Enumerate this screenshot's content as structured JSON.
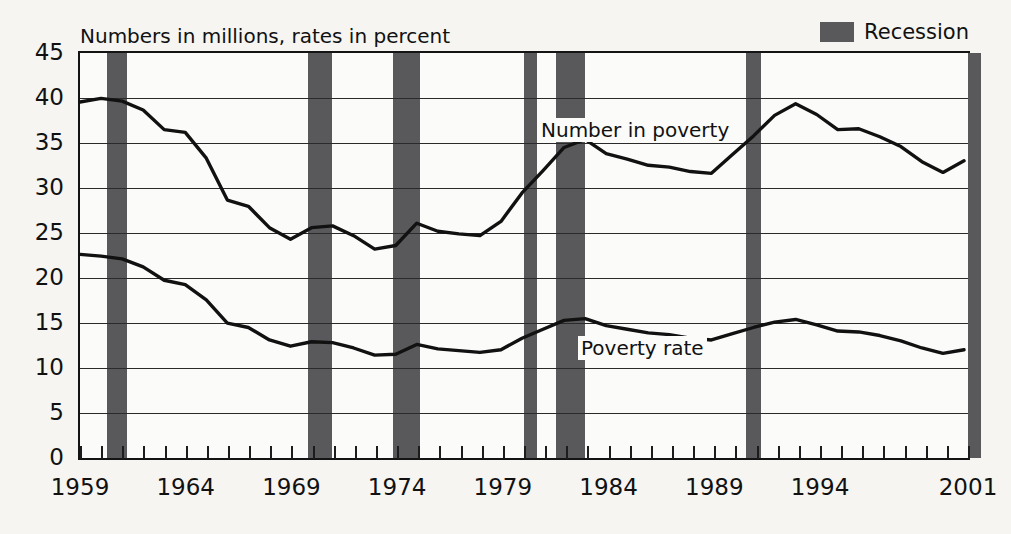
{
  "chart_data": {
    "type": "line",
    "title": "",
    "subtitle": "Numbers in millions, rates in percent",
    "xlabel": "",
    "ylabel": "",
    "ylim": [
      0,
      45
    ],
    "ytick_step": 5,
    "yticks": [
      "45",
      "40",
      "35",
      "30",
      "25",
      "20",
      "15",
      "10",
      "5",
      "0"
    ],
    "xlim": [
      1959,
      2001
    ],
    "xticks": [
      "1959",
      "1964",
      "1969",
      "1974",
      "1979",
      "1984",
      "1989",
      "1994",
      "2001"
    ],
    "xtick_values": [
      1959,
      1964,
      1969,
      1974,
      1979,
      1984,
      1989,
      1994,
      2001
    ],
    "grid": "horizontal",
    "legend_position": "top-right",
    "legend": [
      {
        "label": "Recession",
        "color": "#59595b",
        "kind": "band"
      }
    ],
    "annotations": [
      {
        "label": "Number in poverty",
        "x": 1984,
        "y": 37.5
      },
      {
        "label": "Poverty rate",
        "x": 1986,
        "y": 13.0
      }
    ],
    "x": [
      1959,
      1960,
      1961,
      1962,
      1963,
      1964,
      1965,
      1966,
      1967,
      1968,
      1969,
      1970,
      1971,
      1972,
      1973,
      1974,
      1975,
      1976,
      1977,
      1978,
      1979,
      1980,
      1981,
      1982,
      1983,
      1984,
      1985,
      1986,
      1987,
      1988,
      1989,
      1990,
      1991,
      1992,
      1993,
      1994,
      1995,
      1996,
      1997,
      1998,
      1999,
      2000,
      2001
    ],
    "series": [
      {
        "name": "Number in poverty",
        "units": "millions",
        "color": "#111111",
        "values": [
          39.5,
          39.9,
          39.6,
          38.6,
          36.4,
          36.1,
          33.2,
          28.5,
          27.8,
          25.4,
          24.1,
          25.4,
          25.6,
          24.5,
          23.0,
          23.4,
          25.9,
          25.0,
          24.7,
          24.5,
          26.1,
          29.3,
          31.8,
          34.4,
          35.3,
          33.7,
          33.1,
          32.4,
          32.2,
          31.7,
          31.5,
          33.6,
          35.7,
          38.0,
          39.3,
          38.1,
          36.4,
          36.5,
          35.6,
          34.5,
          32.8,
          31.6,
          32.9
        ]
      },
      {
        "name": "Poverty rate",
        "units": "percent",
        "color": "#111111",
        "values": [
          22.4,
          22.2,
          21.9,
          21.0,
          19.5,
          19.0,
          17.3,
          14.7,
          14.2,
          12.8,
          12.1,
          12.6,
          12.5,
          11.9,
          11.1,
          11.2,
          12.3,
          11.8,
          11.6,
          11.4,
          11.7,
          13.0,
          14.0,
          15.0,
          15.2,
          14.4,
          14.0,
          13.6,
          13.4,
          13.0,
          12.8,
          13.5,
          14.2,
          14.8,
          15.1,
          14.5,
          13.8,
          13.7,
          13.3,
          12.7,
          11.9,
          11.3,
          11.7
        ]
      }
    ],
    "recession_bands": [
      {
        "start": 1960.3,
        "end": 1961.2
      },
      {
        "start": 1969.8,
        "end": 1970.9
      },
      {
        "start": 1973.8,
        "end": 1975.1
      },
      {
        "start": 1980.0,
        "end": 1980.6
      },
      {
        "start": 1981.5,
        "end": 1982.9
      },
      {
        "start": 1990.5,
        "end": 1991.2
      },
      {
        "start": 2001.0,
        "end": 2001.6
      }
    ]
  }
}
